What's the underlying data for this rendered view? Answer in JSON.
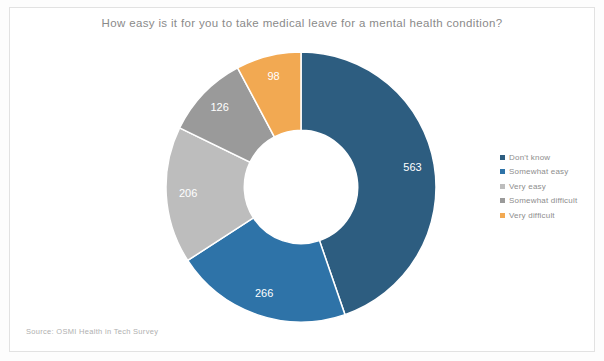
{
  "chart_data": {
    "type": "pie",
    "variant": "donut",
    "title": "How easy is it for you to take medical leave for a mental health condition?",
    "categories": [
      "Don't know",
      "Somewhat easy",
      "Very easy",
      "Somewhat difficult",
      "Very difficult"
    ],
    "values": [
      563,
      266,
      206,
      126,
      98
    ],
    "colors": [
      "#2d5d80",
      "#2e73a8",
      "#bdbdbd",
      "#9a9a9a",
      "#f2a952"
    ],
    "total": 1259,
    "start_angle_deg": 0,
    "direction": "clockwise",
    "inner_radius_ratio": 0.42,
    "data_labels": [
      "563",
      "266",
      "206",
      "126",
      "98"
    ],
    "data_label_color": "#ffffff",
    "legend_position": "right",
    "xlabel": "",
    "ylabel": "",
    "grid": false
  },
  "title": {
    "text": "How easy is it for you to take medical leave for a mental health condition?",
    "color": "#8a8a8a"
  },
  "legend": {
    "items": [
      {
        "label": "Don't know",
        "color": "#2d5d80"
      },
      {
        "label": "Somewhat easy",
        "color": "#2e73a8"
      },
      {
        "label": "Very easy",
        "color": "#bdbdbd"
      },
      {
        "label": "Somewhat difficult",
        "color": "#9a9a9a"
      },
      {
        "label": "Very difficult",
        "color": "#f2a952"
      }
    ]
  },
  "footer": {
    "source": "Source: OSMI Health in Tech Survey"
  }
}
